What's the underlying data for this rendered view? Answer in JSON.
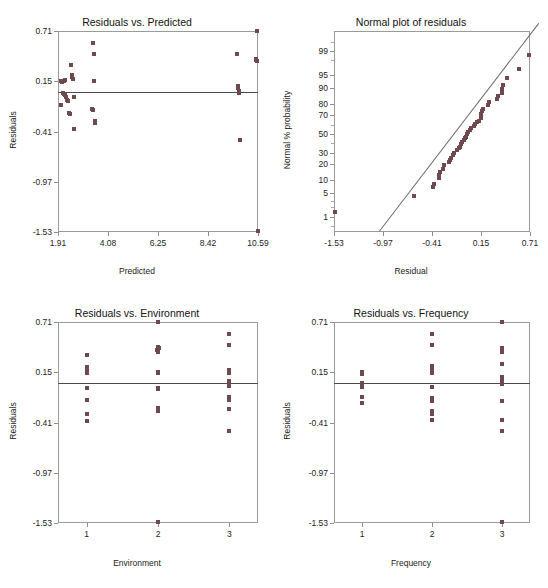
{
  "page": {
    "clipped_header_text": "",
    "marker_color": "#6e4a4e",
    "line_color": "#4b4b4b",
    "frame_color": "#9a9a9a"
  },
  "chart_data": [
    {
      "id": "residuals-vs-predicted",
      "type": "scatter",
      "title": "Residuals vs. Predicted",
      "xlabel": "Predicted",
      "ylabel": "Residuals",
      "xlim": [
        1.91,
        10.59
      ],
      "ylim": [
        -1.53,
        0.71
      ],
      "xticks": [
        1.91,
        4.08,
        6.25,
        8.42,
        10.59
      ],
      "xticklabels": [
        "1.91",
        "4.08",
        "6.25",
        "8.42",
        "10.59"
      ],
      "yticks": [
        0.71,
        0.15,
        -0.41,
        -0.97,
        -1.53
      ],
      "yticklabels": [
        "0.71",
        "0.15",
        "-0.41",
        "-0.97",
        "-1.53"
      ],
      "grid": false,
      "reference_line_y": 0.03,
      "points": [
        [
          2.05,
          0.15
        ],
        [
          2.1,
          0.14
        ],
        [
          2.16,
          0.15
        ],
        [
          2.2,
          0.16
        ],
        [
          2.12,
          0.02
        ],
        [
          2.18,
          0.01
        ],
        [
          2.22,
          0.0
        ],
        [
          2.26,
          -0.02
        ],
        [
          2.3,
          -0.06
        ],
        [
          2.34,
          -0.07
        ],
        [
          2.05,
          -0.12
        ],
        [
          2.38,
          -0.2
        ],
        [
          2.42,
          -0.21
        ],
        [
          2.46,
          0.33
        ],
        [
          2.52,
          0.2
        ],
        [
          2.5,
          0.22
        ],
        [
          2.55,
          0.17
        ],
        [
          2.6,
          -0.38
        ],
        [
          2.62,
          -0.03
        ],
        [
          3.42,
          0.58
        ],
        [
          3.48,
          0.45
        ],
        [
          3.46,
          0.15
        ],
        [
          3.4,
          -0.16
        ],
        [
          3.44,
          -0.17
        ],
        [
          3.5,
          -0.29
        ],
        [
          3.52,
          -0.31
        ],
        [
          9.7,
          0.45
        ],
        [
          9.72,
          0.1
        ],
        [
          9.74,
          0.07
        ],
        [
          9.76,
          0.04
        ],
        [
          9.78,
          0.02
        ],
        [
          9.8,
          -0.5
        ],
        [
          10.55,
          0.71
        ],
        [
          10.52,
          0.4
        ],
        [
          10.56,
          0.38
        ],
        [
          10.5,
          0.39
        ],
        [
          10.58,
          -1.52
        ]
      ]
    },
    {
      "id": "normal-plot-of-residuals",
      "type": "scatter",
      "title": "Normal plot of residuals",
      "xlabel": "Residual",
      "ylabel": "Normal % probability",
      "xlim": [
        -1.53,
        0.71
      ],
      "ylim": [
        0.3,
        99.8
      ],
      "xticks": [
        -1.53,
        -0.97,
        -0.41,
        0.15,
        0.71
      ],
      "xticklabels": [
        "-1.53",
        "-0.97",
        "-0.41",
        "0.15",
        "0.71"
      ],
      "yticks": [
        99,
        95,
        90,
        80,
        70,
        50,
        30,
        20,
        10,
        5,
        1
      ],
      "yticklabels": [
        "99",
        "95",
        "90",
        "80",
        "70",
        "50",
        "30",
        "20",
        "10",
        "5",
        "1"
      ],
      "grid": false,
      "fit_line": {
        "x1": -1.02,
        "y1": 0.32,
        "x2": 0.8,
        "y2": 99.9
      },
      "points": [
        [
          -1.52,
          1.4
        ],
        [
          -0.62,
          4.2
        ],
        [
          -0.4,
          7.0
        ],
        [
          -0.385,
          8.2
        ],
        [
          -0.335,
          11.0
        ],
        [
          -0.325,
          12.5
        ],
        [
          -0.315,
          14.0
        ],
        [
          -0.29,
          16.5
        ],
        [
          -0.275,
          19.0
        ],
        [
          -0.22,
          21.5
        ],
        [
          -0.205,
          23.0
        ],
        [
          -0.195,
          25.0
        ],
        [
          -0.175,
          27.5
        ],
        [
          -0.16,
          30.0
        ],
        [
          -0.12,
          32.5
        ],
        [
          -0.105,
          34.5
        ],
        [
          -0.09,
          36.0
        ],
        [
          -0.075,
          38.5
        ],
        [
          -0.065,
          40.5
        ],
        [
          -0.04,
          43.0
        ],
        [
          -0.03,
          45.0
        ],
        [
          -0.02,
          47.0
        ],
        [
          -0.005,
          49.5
        ],
        [
          0.005,
          51.5
        ],
        [
          0.02,
          54.0
        ],
        [
          0.04,
          56.0
        ],
        [
          0.07,
          58.5
        ],
        [
          0.085,
          60.5
        ],
        [
          0.105,
          62.5
        ],
        [
          0.125,
          64.5
        ],
        [
          0.145,
          67.0
        ],
        [
          0.15,
          69.0
        ],
        [
          0.155,
          71.5
        ],
        [
          0.16,
          73.5
        ],
        [
          0.17,
          76.0
        ],
        [
          0.225,
          79.0
        ],
        [
          0.245,
          81.0
        ],
        [
          0.33,
          83.5
        ],
        [
          0.345,
          85.5
        ],
        [
          0.385,
          87.5
        ],
        [
          0.395,
          89.5
        ],
        [
          0.4,
          91.5
        ],
        [
          0.45,
          94.0
        ],
        [
          0.58,
          96.5
        ],
        [
          0.7,
          98.6
        ]
      ]
    },
    {
      "id": "residuals-vs-environment",
      "type": "scatter",
      "title": "Residuals vs. Environment",
      "xlabel": "Environment",
      "ylabel": "Residuals",
      "xlim": [
        0.6,
        3.4
      ],
      "ylim": [
        -1.53,
        0.71
      ],
      "xticks": [
        1,
        2,
        3
      ],
      "xticklabels": [
        "1",
        "2",
        "3"
      ],
      "yticks": [
        0.71,
        0.15,
        -0.41,
        -0.97,
        -1.53
      ],
      "yticklabels": [
        "0.71",
        "0.15",
        "-0.41",
        "-0.97",
        "-1.53"
      ],
      "grid": false,
      "reference_line_y": 0.03,
      "points": [
        [
          1.0,
          0.34
        ],
        [
          1.0,
          0.21
        ],
        [
          1.0,
          0.17
        ],
        [
          1.0,
          0.14
        ],
        [
          1.0,
          -0.02
        ],
        [
          1.0,
          -0.16
        ],
        [
          1.0,
          -0.31
        ],
        [
          1.0,
          -0.39
        ],
        [
          2.0,
          0.71
        ],
        [
          2.0,
          0.43
        ],
        [
          2.02,
          0.42
        ],
        [
          1.99,
          0.4
        ],
        [
          2.0,
          0.38
        ],
        [
          2.0,
          0.15
        ],
        [
          2.0,
          0.14
        ],
        [
          2.0,
          -0.02
        ],
        [
          2.0,
          -0.04
        ],
        [
          2.0,
          -0.25
        ],
        [
          2.0,
          -0.28
        ],
        [
          2.0,
          -1.52
        ],
        [
          3.0,
          0.58
        ],
        [
          3.0,
          0.45
        ],
        [
          3.0,
          0.17
        ],
        [
          3.0,
          0.14
        ],
        [
          3.0,
          0.05
        ],
        [
          3.0,
          0.02
        ],
        [
          3.0,
          0.0
        ],
        [
          3.0,
          -0.13
        ],
        [
          3.0,
          -0.15
        ],
        [
          3.0,
          -0.16
        ],
        [
          3.0,
          -0.26
        ],
        [
          3.0,
          -0.5
        ]
      ]
    },
    {
      "id": "residuals-vs-frequency",
      "type": "scatter",
      "title": "Residuals vs. Frequency",
      "xlabel": "Frequency",
      "ylabel": "Residuals",
      "xlim": [
        0.6,
        3.4
      ],
      "ylim": [
        -1.53,
        0.71
      ],
      "xticks": [
        1,
        2,
        3
      ],
      "xticklabels": [
        "1",
        "2",
        "3"
      ],
      "yticks": [
        0.71,
        0.15,
        -0.41,
        -0.97,
        -1.53
      ],
      "yticklabels": [
        "0.71",
        "0.15",
        "-0.41",
        "-0.97",
        "-1.53"
      ],
      "grid": false,
      "reference_line_y": 0.03,
      "points": [
        [
          1.0,
          0.15
        ],
        [
          1.0,
          0.13
        ],
        [
          1.0,
          0.03
        ],
        [
          1.0,
          0.01
        ],
        [
          1.0,
          -0.01
        ],
        [
          1.0,
          -0.13
        ],
        [
          1.0,
          -0.19
        ],
        [
          2.0,
          0.58
        ],
        [
          2.0,
          0.45
        ],
        [
          2.0,
          0.22
        ],
        [
          2.0,
          0.2
        ],
        [
          2.0,
          0.15
        ],
        [
          2.0,
          0.14
        ],
        [
          2.0,
          -0.01
        ],
        [
          2.0,
          -0.14
        ],
        [
          2.0,
          -0.16
        ],
        [
          2.0,
          -0.17
        ],
        [
          2.0,
          -0.28
        ],
        [
          2.0,
          -0.31
        ],
        [
          2.0,
          -0.38
        ],
        [
          3.0,
          0.71
        ],
        [
          3.0,
          0.42
        ],
        [
          3.0,
          0.4
        ],
        [
          3.0,
          0.39
        ],
        [
          3.0,
          0.38
        ],
        [
          3.0,
          0.24
        ],
        [
          3.0,
          0.1
        ],
        [
          3.0,
          0.07
        ],
        [
          3.0,
          0.04
        ],
        [
          3.0,
          0.02
        ],
        [
          3.0,
          -0.17
        ],
        [
          3.0,
          -0.38
        ],
        [
          3.0,
          -0.5
        ],
        [
          3.0,
          -1.52
        ]
      ]
    }
  ]
}
